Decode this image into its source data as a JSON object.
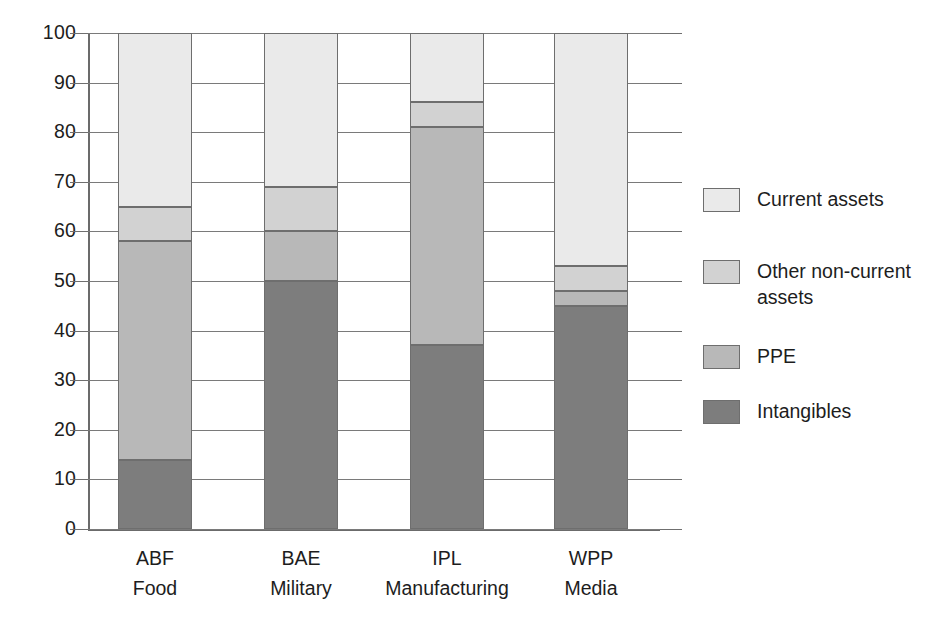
{
  "chart_data": {
    "type": "bar",
    "subtype": "stacked-100-percent",
    "title": "",
    "xlabel": "",
    "ylabel": "",
    "ylim": [
      0,
      100
    ],
    "ytick_step": 10,
    "yticks": [
      0,
      10,
      20,
      30,
      40,
      50,
      60,
      70,
      80,
      90,
      100
    ],
    "ytick_labels": [
      "0",
      "10",
      "20",
      "30",
      "40",
      "50",
      "60",
      "70",
      "80",
      "90",
      "100"
    ],
    "grid": true,
    "legend_position": "right",
    "categories": [
      "ABF",
      "BAE",
      "IPL",
      "WPP"
    ],
    "category_sectors": [
      "Food",
      "Military",
      "Manufacturing",
      "Media"
    ],
    "series": [
      {
        "name": "Intangibles",
        "color": "#7d7d7d",
        "values": [
          14,
          50,
          37,
          45
        ]
      },
      {
        "name": "PPE",
        "color": "#b8b8b8",
        "values": [
          44,
          10,
          44,
          3
        ]
      },
      {
        "name": "Other non-current assets",
        "color": "#d2d2d2",
        "values": [
          7,
          9,
          5,
          5
        ]
      },
      {
        "name": "Current assets",
        "color": "#eaeaea",
        "values": [
          35,
          31,
          14,
          47
        ]
      }
    ],
    "stack_order_bottom_to_top": [
      "Intangibles",
      "PPE",
      "Other non-current assets",
      "Current assets"
    ],
    "cumulative_boundaries": {
      "ABF": [
        0,
        14,
        58,
        65,
        100
      ],
      "BAE": [
        0,
        50,
        60,
        69,
        100
      ],
      "IPL": [
        0,
        37,
        81,
        86,
        100
      ],
      "WPP": [
        0,
        45,
        48,
        53,
        100
      ]
    }
  },
  "legend": {
    "items": [
      {
        "label": "Current assets",
        "color": "#eaeaea"
      },
      {
        "label": "Other non-current assets",
        "color": "#d2d2d2"
      },
      {
        "label": "PPE",
        "color": "#b8b8b8"
      },
      {
        "label": "Intangibles",
        "color": "#7d7d7d"
      }
    ]
  },
  "axes": {
    "y_tick_labels": [
      "100",
      "90",
      "80",
      "70",
      "60",
      "50",
      "40",
      "30",
      "20",
      "10",
      "0"
    ]
  }
}
